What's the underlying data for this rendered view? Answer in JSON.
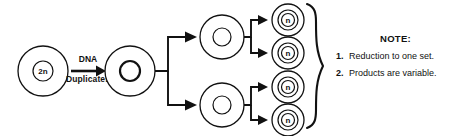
{
  "diagram": {
    "stage_label": {
      "line1": "DNA",
      "line2": "Duplicates"
    },
    "cells": {
      "parent": {
        "ploidy": "2n",
        "name": "parent-cell"
      },
      "duplicated": {
        "ploidy": "",
        "name": "duplicated-cell"
      },
      "intermediate_top": {
        "ploidy": "",
        "name": "intermediate-cell-top"
      },
      "intermediate_bottom": {
        "ploidy": "",
        "name": "intermediate-cell-bottom"
      },
      "products": [
        {
          "ploidy": "n"
        },
        {
          "ploidy": "n"
        },
        {
          "ploidy": "n"
        },
        {
          "ploidy": "n"
        }
      ]
    },
    "colors": {
      "stroke": "#111111",
      "fill": "#ffffff",
      "background": "#ffffff"
    }
  },
  "note": {
    "title": "NOTE:",
    "items": [
      {
        "num": "1.",
        "text": "Reduction to one set."
      },
      {
        "num": "2.",
        "text": "Products are variable."
      }
    ]
  }
}
